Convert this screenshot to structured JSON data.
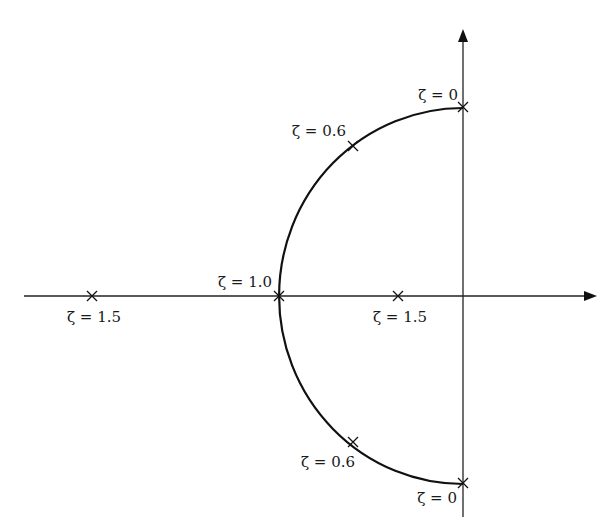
{
  "diagram": {
    "type": "root-locus",
    "axes": {
      "real_axis": {
        "x_start": 24,
        "x_end": 596,
        "y": 296
      },
      "imag_axis": {
        "x": 463,
        "y_start": 30,
        "y_end": 517
      },
      "origin": {
        "x": 463,
        "y": 296
      }
    },
    "locus": {
      "center": {
        "x": 463,
        "y": 296
      },
      "rx": 184,
      "ry": 188,
      "color": "#111111"
    },
    "points": [
      {
        "id": "zeta-0-top",
        "label": "ζ = 0",
        "x": 463,
        "y": 107,
        "label_x": 458,
        "label_y": 100,
        "anchor": "end"
      },
      {
        "id": "zeta-0.6-top",
        "label": "ζ = 0.6",
        "x": 353,
        "y": 146,
        "label_x": 346,
        "label_y": 136,
        "anchor": "end"
      },
      {
        "id": "zeta-1.0",
        "label": "ζ = 1.0",
        "x": 279,
        "y": 296,
        "label_x": 272,
        "label_y": 287,
        "anchor": "end"
      },
      {
        "id": "zeta-1.5-left",
        "label": "ζ = 1.5",
        "x": 92,
        "y": 296,
        "label_x": 94,
        "label_y": 322,
        "anchor": "middle"
      },
      {
        "id": "zeta-1.5-right",
        "label": "ζ = 1.5",
        "x": 398,
        "y": 296,
        "label_x": 400,
        "label_y": 322,
        "anchor": "middle"
      },
      {
        "id": "zeta-0.6-bottom",
        "label": "ζ = 0.6",
        "x": 353,
        "y": 442,
        "label_x": 328,
        "label_y": 467,
        "anchor": "middle"
      },
      {
        "id": "zeta-0-bottom",
        "label": "ζ = 0",
        "x": 463,
        "y": 483,
        "label_x": 457,
        "label_y": 503,
        "anchor": "end"
      }
    ]
  }
}
